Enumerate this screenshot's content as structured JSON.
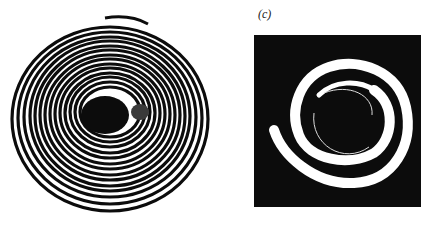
{
  "figure": {
    "panels": [
      {
        "id": "left",
        "description": "Concentric ring pattern (black rings on white) with dark central core",
        "colors": {
          "background": "#ffffff",
          "rings": "#0c0c0c",
          "core": "#0c0c0c"
        }
      },
      {
        "id": "right",
        "label": "(c)",
        "description": "Spiral white band on black square background",
        "colors": {
          "background": "#0c0c0c",
          "spiral": "#ffffff"
        }
      }
    ]
  }
}
